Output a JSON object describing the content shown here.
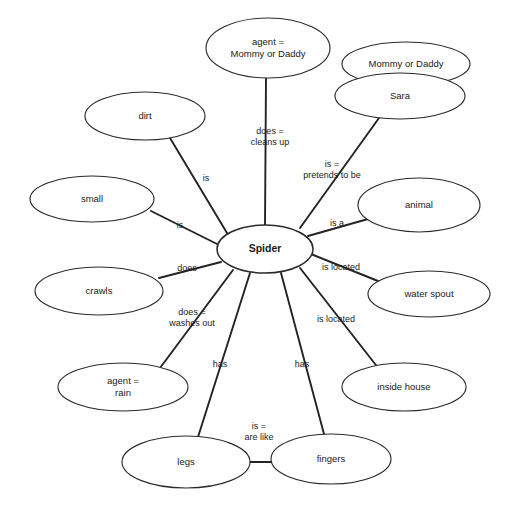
{
  "diagram": {
    "type": "concept-map",
    "background_color": "#ffffff",
    "node_fill": "#ffffff",
    "node_stroke": "#2b2b2b",
    "edge_color": "#232323",
    "text_color": "#1a1a1a",
    "center_node": "Spider",
    "nodes": [
      {
        "id": "spider",
        "label": "Spider",
        "cx": 265,
        "cy": 249,
        "rx": 48,
        "ry": 24,
        "bold": true,
        "lines": [
          "Spider"
        ]
      },
      {
        "id": "agent_parent",
        "label": "agent = Mommy or Daddy",
        "cx": 268,
        "cy": 48,
        "rx": 62,
        "ry": 30,
        "bold": false,
        "lines": [
          "agent =",
          "Mommy or Daddy"
        ]
      },
      {
        "id": "mommy_daddy",
        "label": "Mommy or Daddy",
        "cx": 406,
        "cy": 64,
        "rx": 64,
        "ry": 22,
        "bold": false,
        "lines": [
          "Mommy or Daddy"
        ]
      },
      {
        "id": "sara",
        "label": "Sara",
        "cx": 400,
        "cy": 96,
        "rx": 65,
        "ry": 23,
        "bold": false,
        "lines": [
          "Sara"
        ]
      },
      {
        "id": "dirt",
        "label": "dirt",
        "cx": 145,
        "cy": 116,
        "rx": 60,
        "ry": 24,
        "bold": false,
        "lines": [
          "dirt"
        ]
      },
      {
        "id": "small",
        "label": "small",
        "cx": 92,
        "cy": 199,
        "rx": 62,
        "ry": 23,
        "bold": false,
        "lines": [
          "small"
        ]
      },
      {
        "id": "crawls",
        "label": "crawls",
        "cx": 99,
        "cy": 291,
        "rx": 64,
        "ry": 24,
        "bold": false,
        "lines": [
          "crawls"
        ]
      },
      {
        "id": "agent_rain",
        "label": "agent = rain",
        "cx": 123,
        "cy": 387,
        "rx": 65,
        "ry": 24,
        "bold": false,
        "lines": [
          "agent =",
          "rain"
        ]
      },
      {
        "id": "legs",
        "label": "legs",
        "cx": 186,
        "cy": 462,
        "rx": 64,
        "ry": 26,
        "bold": false,
        "lines": [
          "legs"
        ]
      },
      {
        "id": "fingers",
        "label": "fingers",
        "cx": 331,
        "cy": 459,
        "rx": 60,
        "ry": 25,
        "bold": false,
        "lines": [
          "fingers"
        ]
      },
      {
        "id": "inside_house",
        "label": "inside house",
        "cx": 404,
        "cy": 387,
        "rx": 62,
        "ry": 24,
        "bold": false,
        "lines": [
          "inside house"
        ]
      },
      {
        "id": "water_spout",
        "label": "water spout",
        "cx": 429,
        "cy": 294,
        "rx": 61,
        "ry": 23,
        "bold": false,
        "lines": [
          "water spout"
        ]
      },
      {
        "id": "animal",
        "label": "animal",
        "cx": 419,
        "cy": 205,
        "rx": 61,
        "ry": 27,
        "bold": false,
        "lines": [
          "animal"
        ]
      }
    ],
    "edges": [
      {
        "id": "e-agent-parent",
        "from": "spider",
        "to": "agent_parent",
        "x1": 265,
        "y1": 225,
        "x2": 266,
        "y2": 78,
        "label": "does = cleans up",
        "lines": [
          "does =",
          "cleans up"
        ],
        "lx": 270,
        "ly": 137
      },
      {
        "id": "e-sara",
        "from": "spider",
        "to": "sara",
        "x1": 300,
        "y1": 228,
        "x2": 379,
        "y2": 118,
        "label": "is = pretends to be",
        "lines": [
          "is =",
          "pretends to be"
        ],
        "lx": 332,
        "ly": 170
      },
      {
        "id": "e-dirt",
        "from": "spider",
        "to": "dirt",
        "x1": 227,
        "y1": 233,
        "x2": 170,
        "y2": 138,
        "label": "is",
        "lines": [
          "is"
        ],
        "lx": 206,
        "ly": 179
      },
      {
        "id": "e-small",
        "from": "spider",
        "to": "small",
        "x1": 219,
        "y1": 245,
        "x2": 151,
        "y2": 211,
        "label": "is",
        "lines": [
          "is"
        ],
        "lx": 180,
        "ly": 226
      },
      {
        "id": "e-crawls",
        "from": "spider",
        "to": "crawls",
        "x1": 221,
        "y1": 262,
        "x2": 159,
        "y2": 278,
        "label": "does",
        "lines": [
          "does"
        ],
        "lx": 187,
        "ly": 269
      },
      {
        "id": "e-rain",
        "from": "spider",
        "to": "agent_rain",
        "x1": 233,
        "y1": 270,
        "x2": 160,
        "y2": 368,
        "label": "does = washes out",
        "lines": [
          "does =",
          "washes out"
        ],
        "lx": 192,
        "ly": 318
      },
      {
        "id": "e-legs",
        "from": "spider",
        "to": "legs",
        "x1": 250,
        "y1": 273,
        "x2": 198,
        "y2": 437,
        "label": "has",
        "lines": [
          "has"
        ],
        "lx": 220,
        "ly": 365
      },
      {
        "id": "e-fingers",
        "from": "spider",
        "to": "fingers",
        "x1": 281,
        "y1": 273,
        "x2": 324,
        "y2": 434,
        "label": "has",
        "lines": [
          "has"
        ],
        "lx": 302,
        "ly": 365
      },
      {
        "id": "e-inside",
        "from": "spider",
        "to": "inside_house",
        "x1": 300,
        "y1": 268,
        "x2": 379,
        "y2": 369,
        "label": "is located",
        "lines": [
          "is located"
        ],
        "lx": 336,
        "ly": 320
      },
      {
        "id": "e-spout",
        "from": "spider",
        "to": "water_spout",
        "x1": 311,
        "y1": 254,
        "x2": 378,
        "y2": 281,
        "label": "is located",
        "lines": [
          "is located"
        ],
        "lx": 341,
        "ly": 268
      },
      {
        "id": "e-animal",
        "from": "spider",
        "to": "animal",
        "x1": 308,
        "y1": 236,
        "x2": 368,
        "y2": 219,
        "label": "is a",
        "lines": [
          "is a"
        ],
        "lx": 337,
        "ly": 224
      },
      {
        "id": "e-legs-fingers",
        "from": "legs",
        "to": "fingers",
        "x1": 250,
        "y1": 462,
        "x2": 272,
        "y2": 462,
        "label": "is = are like",
        "lines": [
          "is =",
          "are like"
        ],
        "lx": 259,
        "ly": 432
      }
    ]
  }
}
